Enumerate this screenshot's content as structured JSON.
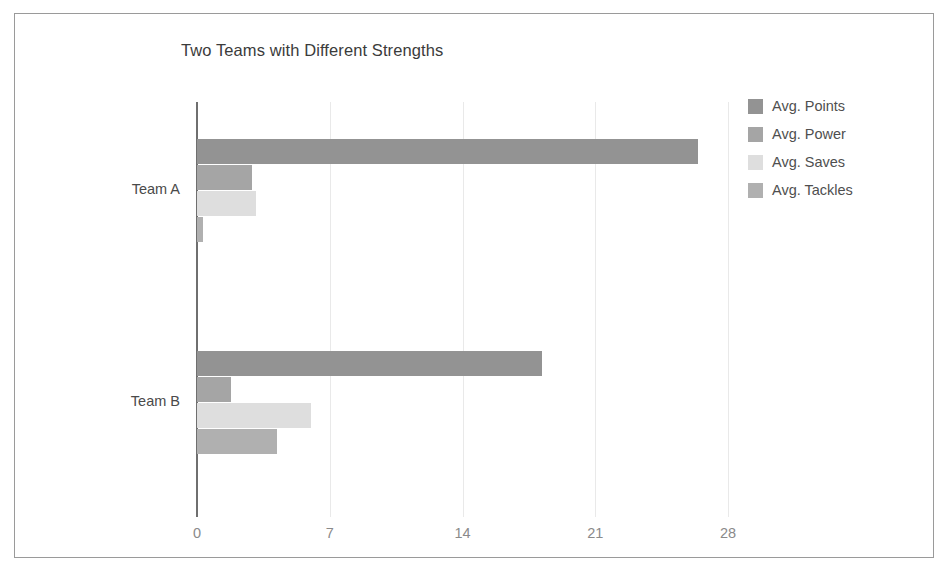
{
  "chart_data": {
    "type": "bar",
    "orientation": "horizontal",
    "title": "Two Teams with Different Strengths",
    "xlabel": "",
    "ylabel": "",
    "categories": [
      "Team A",
      "Team B"
    ],
    "series": [
      {
        "name": "Avg. Points",
        "values": [
          26.4,
          18.2
        ],
        "color": "#939393"
      },
      {
        "name": "Avg. Power",
        "values": [
          2.9,
          1.8
        ],
        "color": "#a5a5a5"
      },
      {
        "name": "Avg. Saves",
        "values": [
          3.1,
          6.0
        ],
        "color": "#dedede"
      },
      {
        "name": "Avg. Tackles",
        "values": [
          0.3,
          4.2
        ],
        "color": "#b0b0b0"
      }
    ],
    "xlim": [
      0,
      28
    ],
    "xticks": [
      0,
      7,
      14,
      21,
      28
    ],
    "xticklabels": [
      "0",
      "7",
      "14",
      "21",
      "28"
    ],
    "grid": true,
    "grid_axis": "x",
    "legend": true,
    "legend_position": "right",
    "legend_entries": [
      "Avg. Points",
      "Avg. Power",
      "Avg. Saves",
      "Avg. Tackles"
    ],
    "background_color": "#ffffff",
    "border_color": "#9a9a9a",
    "axis_color": "#6f6f6f",
    "gridline_color": "#e9e9e9",
    "tick_label_color": "#8a8a8a",
    "title_color": "#3b3b3b"
  }
}
